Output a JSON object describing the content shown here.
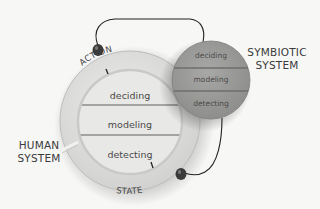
{
  "human_system": {
    "label_line1": "HUMAN",
    "label_line2": "SYSTEM",
    "layers": [
      "deciding",
      "modeling",
      "detecting"
    ],
    "ring_labels": {
      "top": "ACTION",
      "bottom": "STATE"
    }
  },
  "symbiotic_system": {
    "label_line1": "SYMBIOTIC",
    "label_line2": "SYSTEM",
    "layers": [
      "deciding",
      "modeling",
      "detecting"
    ]
  },
  "colors": {
    "background": "#f7f7f6",
    "ring": "#dcdcda",
    "inner": "#e9e9e7",
    "symbiotic_fill": "#9a9a98",
    "divider": "#8c8c8a",
    "wire": "#222222",
    "knob": "#3a3a3a"
  }
}
